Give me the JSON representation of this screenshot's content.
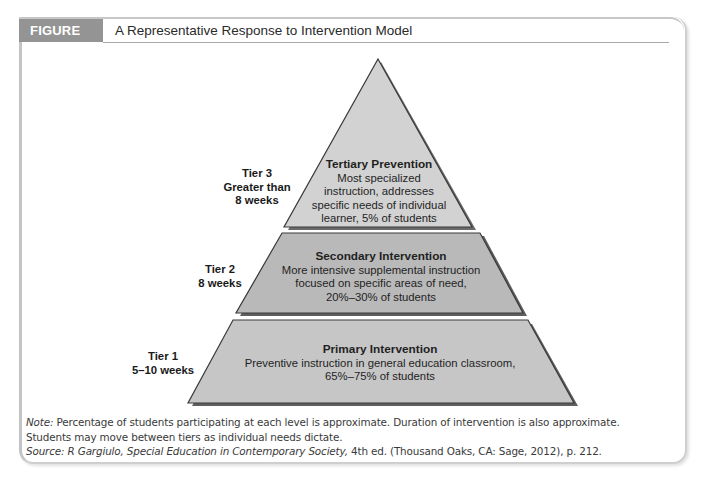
{
  "figure": {
    "label": "FIGURE 10-5",
    "title": "A Representative Response to Intervention Model",
    "label_bg_color": "#949494"
  },
  "pyramid": {
    "fill_colors": {
      "tier3": "#d2d2d2",
      "tier2": "#b9b9b9",
      "tier1": "#c6c6c6"
    },
    "tiers": [
      {
        "tier": "Tier 3",
        "duration_lines": [
          "Greater than",
          "8 weeks"
        ],
        "name": "Tertiary Prevention",
        "description_lines": [
          "Most specialized",
          "instruction, addresses",
          "specific needs of individual",
          "learner, 5% of students"
        ]
      },
      {
        "tier": "Tier 2",
        "duration_lines": [
          "8 weeks"
        ],
        "name": "Secondary Intervention",
        "description_lines": [
          "More intensive supplemental instruction",
          "focused on specific areas of need,",
          "20%–30% of students"
        ]
      },
      {
        "tier": "Tier 1",
        "duration_lines": [
          "5–10 weeks"
        ],
        "name": "Primary Intervention",
        "description_lines": [
          "Preventive instruction in general education classroom,",
          "65%–75% of students"
        ]
      }
    ]
  },
  "note": {
    "prefix": "Note:",
    "text_line1": " Percentage of students participating at each level is approximate. Duration of intervention is also approximate.",
    "text_line2": "Students may move between tiers as individual needs dictate."
  },
  "source": {
    "prefix": "Source: R Gargiulo, ",
    "book_title": "Special Education in Contemporary Society,",
    "suffix": " 4th ed. (Thousand Oaks, CA: Sage, 2012), p. 212."
  }
}
